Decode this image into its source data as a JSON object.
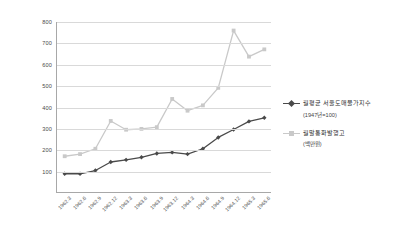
{
  "chart_data": {
    "type": "line",
    "title": "",
    "subtitle": "",
    "xlabel": "",
    "ylabel": "",
    "ylim": [
      0,
      800
    ],
    "ytick_step": 100,
    "yticks": [
      800,
      700,
      600,
      500,
      400,
      300,
      200,
      100
    ],
    "grid": true,
    "legend_position": "right",
    "categories": [
      "1962.3",
      "1962.6",
      "1962.9",
      "1962.12",
      "1963.3",
      "1963.6",
      "1963.9",
      "1963.12",
      "1964.3",
      "1964.6",
      "1964.9",
      "1964.12",
      "1965.3",
      "1965.6"
    ],
    "series": [
      {
        "name": "월평균 서울도매물가지수",
        "unit": "(1947년=100)",
        "color": "#4a4a4a",
        "marker": "diamond",
        "values": [
          90,
          90,
          105,
          145,
          155,
          167,
          185,
          190,
          182,
          207,
          260,
          297,
          335,
          352
        ]
      },
      {
        "name": "월말통화발행고",
        "unit": "(백만원)",
        "color": "#c9c9c9",
        "marker": "square",
        "values": [
          172,
          182,
          207,
          337,
          296,
          300,
          308,
          440,
          385,
          410,
          492,
          760,
          638,
          672
        ]
      }
    ]
  },
  "legend": {
    "entries": [
      {
        "label": "월평균 서울도매물가지수",
        "sub": "(1947년=100)"
      },
      {
        "label": "월말통화발행고",
        "sub": "(백만원)"
      }
    ]
  },
  "colors": {
    "series_dark": "#4a4a4a",
    "series_light": "#c9c9c9",
    "grid": "#d9d9d9",
    "axis": "#a8a8a8",
    "text": "#4a4a4a",
    "background": "#ffffff"
  }
}
